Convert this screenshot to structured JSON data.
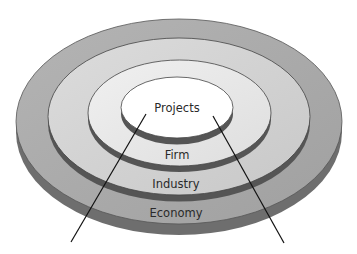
{
  "diagram": {
    "type": "nested-concentric-discs",
    "layers": [
      {
        "id": "economy",
        "label": "Economy",
        "fill": "#a9a9a9",
        "side": "#6e6e6e"
      },
      {
        "id": "industry",
        "label": "Industry",
        "fill": "#d2d2d2",
        "side": "#5a5a5a"
      },
      {
        "id": "firm",
        "label": "Firm",
        "fill": "#e6e6e6",
        "side": "#5a5a5a"
      },
      {
        "id": "projects",
        "label": "Projects",
        "fill": "#ffffff",
        "side": "#5a5a5a"
      }
    ],
    "pointer_lines": 2
  }
}
